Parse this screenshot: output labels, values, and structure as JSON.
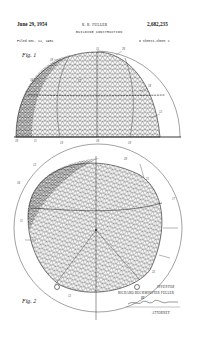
{
  "header": {
    "date": "June 29, 1954",
    "inventor_short": "R. B. FULLER",
    "patent_number": "2,682,235",
    "title": "BUILDING CONSTRUCTION",
    "filed": "Filed Dec. 12, 1951",
    "sheets": "8 Sheets-Sheet 1"
  },
  "figures": [
    {
      "label": "Fig. 1",
      "description": "Geodesic dome elevation view"
    },
    {
      "label": "Fig. 2",
      "description": "Geodesic dome plan view"
    }
  ],
  "reference_numerals": {
    "fig1": [
      "18",
      "15",
      "20",
      "16",
      "17",
      "18",
      "12",
      "11",
      "10",
      "19",
      "19"
    ],
    "fig2": [
      "13",
      "16",
      "20",
      "21",
      "17",
      "11",
      "23",
      "12"
    ]
  },
  "signature_block": {
    "inventor_label": "INVENTOR",
    "inventor_name": "RICHARD BUCKMINSTER FULLER",
    "by": "BY",
    "attorney_label": "ATTORNEY"
  },
  "colors": {
    "ink": "#222222",
    "paper": "#ffffff"
  }
}
